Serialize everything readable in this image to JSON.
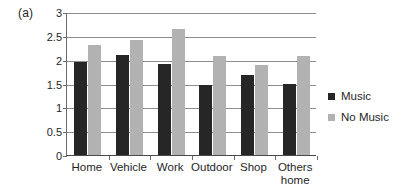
{
  "panel": {
    "label": "(a)"
  },
  "chart_data": {
    "type": "bar",
    "title": "",
    "subtitle": "",
    "xlabel": "",
    "ylabel": "",
    "ylim": [
      0,
      3
    ],
    "ytick_values": [
      3,
      2.5,
      2,
      1.5,
      1,
      0.5,
      0
    ],
    "ytick_labels": [
      "3",
      "2.5",
      "2",
      "1.5",
      "1",
      "0.5",
      "0"
    ],
    "grid": true,
    "grid_axis": "y",
    "legend_position": "right",
    "categories": [
      "Home",
      "Vehicle",
      "Work",
      "Outdoor",
      "Shop",
      "Others home"
    ],
    "category_labels": [
      "Home",
      "Vehicle",
      "Work",
      "Outdoor",
      "Shop",
      "Others\nhome"
    ],
    "series": [
      {
        "name": "Music",
        "color": "#262626",
        "values": [
          1.96,
          2.1,
          1.9,
          1.46,
          1.67,
          1.48
        ]
      },
      {
        "name": "No Music",
        "color": "#b2b2b2",
        "values": [
          2.3,
          2.42,
          2.65,
          2.07,
          1.88,
          2.07
        ]
      }
    ]
  },
  "legend": {
    "entries": [
      {
        "label": "Music"
      },
      {
        "label": "No Music"
      }
    ]
  }
}
